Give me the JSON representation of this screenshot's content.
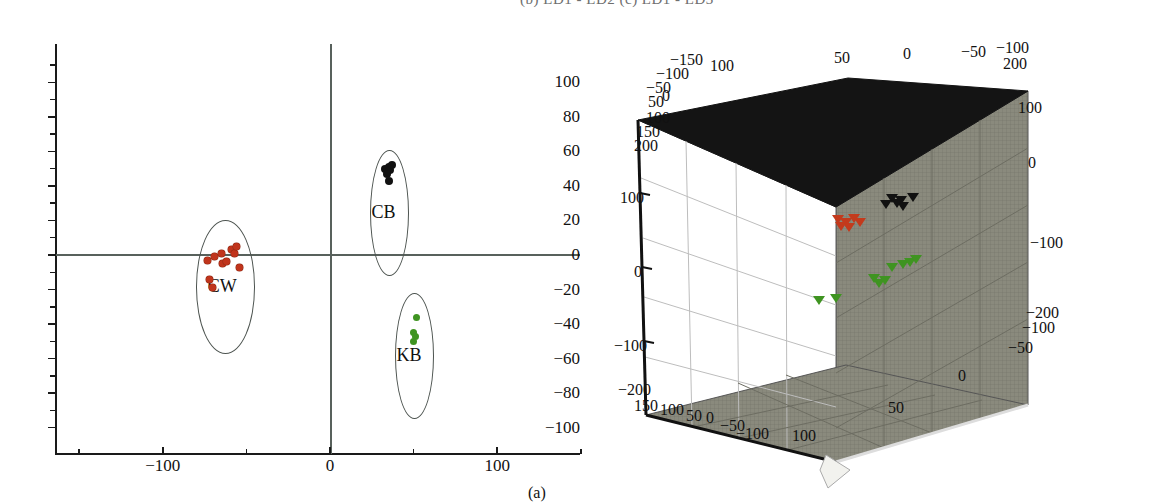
{
  "figure": {
    "top_fragment_text": "(b) LD1 - LD2   (c) LD1 - LD3",
    "panel_a_caption": "(a)"
  },
  "chart_data": [
    {
      "type": "scatter",
      "id": "panel-a",
      "title": "",
      "xlabel": "",
      "ylabel": "",
      "xlim": [
        -160,
        150
      ],
      "ylim": [
        -108,
        112
      ],
      "grid": false,
      "legend": "none",
      "xticks": [
        -100,
        0,
        100
      ],
      "xtick_labels": [
        "−100",
        "0",
        "100"
      ],
      "yticks": [
        -100,
        -80,
        -60,
        -40,
        -20,
        0,
        20,
        40,
        60,
        80,
        100
      ],
      "ytick_labels": [
        "−100",
        "−80",
        "−60",
        "−40",
        "−20",
        "0",
        "20",
        "40",
        "60",
        "80",
        "100"
      ],
      "series": [
        {
          "name": "CW",
          "color": "#c0341c",
          "marker": "circle",
          "points": [
            [
              -73,
              -3
            ],
            [
              -69,
              -1
            ],
            [
              -65,
              1
            ],
            [
              -64,
              -5
            ],
            [
              -62,
              -4
            ],
            [
              -59,
              3
            ],
            [
              -57,
              1
            ],
            [
              -56,
              5
            ],
            [
              -54,
              -7
            ],
            [
              -72,
              -14
            ],
            [
              -70,
              -19
            ]
          ]
        },
        {
          "name": "CB",
          "color": "#111111",
          "marker": "circle",
          "points": [
            [
              33,
              50
            ],
            [
              35,
              51
            ],
            [
              36,
              49
            ],
            [
              34,
              47
            ],
            [
              37,
              52
            ],
            [
              35,
              43
            ]
          ]
        },
        {
          "name": "KB",
          "color": "#3f9421",
          "marker": "circle",
          "points": [
            [
              52,
              -36
            ],
            [
              50,
              -45
            ],
            [
              51,
              -47
            ],
            [
              50,
              -50
            ]
          ]
        }
      ],
      "clusters": [
        {
          "label": "CW",
          "cx": -63,
          "cy": -18,
          "rx": 17,
          "ry": 38
        },
        {
          "label": "CB",
          "cx": 35,
          "cy": 25,
          "rx": 11,
          "ry": 36
        },
        {
          "label": "KB",
          "cx": 50,
          "cy": -58,
          "rx": 11,
          "ry": 36
        }
      ]
    },
    {
      "type": "scatter",
      "id": "panel-b-3d",
      "projection": "3d",
      "title": "",
      "grid": true,
      "legend": "none",
      "axis_top_labels": [
        "100",
        "50",
        "0",
        "−50",
        "−100"
      ],
      "axis_top_diag_labels": [
        "−150",
        "−100",
        "−50",
        "0",
        "50",
        "100",
        "150",
        "200"
      ],
      "axis_left_labels": [
        "200",
        "100",
        "0",
        "−100",
        "−200"
      ],
      "axis_right_labels": [
        "200",
        "100",
        "0",
        "−100",
        "−200"
      ],
      "axis_bottom_diag_labels": [
        "150",
        "100",
        "50",
        "0",
        "−50",
        "−100"
      ],
      "axis_bottom_right_labels": [
        "100",
        "50",
        "0",
        "−50",
        "−100"
      ],
      "series": [
        {
          "name": "CB",
          "color": "#111111",
          "marker": "triangle",
          "points": [
            [
              892,
              198
            ],
            [
              901,
              200
            ],
            [
              913,
              197
            ],
            [
              903,
              206
            ],
            [
              886,
              204
            ],
            [
              897,
              203
            ]
          ]
        },
        {
          "name": "CW",
          "color": "#c33a1c",
          "marker": "triangle",
          "points": [
            [
              838,
              219
            ],
            [
              846,
              222
            ],
            [
              854,
              218
            ],
            [
              860,
              222
            ],
            [
              849,
              227
            ],
            [
              841,
              226
            ]
          ]
        },
        {
          "name": "KB",
          "color": "#3f9421",
          "marker": "triangle",
          "points": [
            [
              819,
              300
            ],
            [
              836,
              298
            ],
            [
              874,
              278
            ],
            [
              879,
              283
            ],
            [
              885,
              280
            ],
            [
              892,
              267
            ],
            [
              903,
              264
            ],
            [
              910,
              262
            ],
            [
              916,
              259
            ]
          ]
        }
      ]
    }
  ]
}
